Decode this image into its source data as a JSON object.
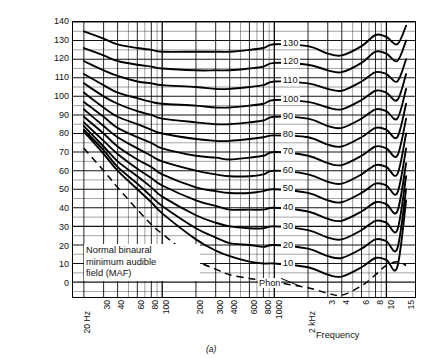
{
  "chart_data": {
    "type": "line",
    "title": "",
    "caption": "(a)",
    "xlabel": "Frequency",
    "ylabel_line1": "Sound pressure level (expressed in decibels)",
    "ylabel_line2": "above 0.0002 dyn/cm2 (2 x 10-5 N/m2)",
    "xscale": "log",
    "xlim": [
      16,
      18000
    ],
    "ylim": [
      -8,
      140
    ],
    "grid": true,
    "legend_position": "inline-labels",
    "yticks": [
      0,
      10,
      20,
      30,
      40,
      50,
      60,
      70,
      80,
      90,
      100,
      110,
      120,
      130,
      140
    ],
    "xticks": [
      {
        "value": 20,
        "label": "20 Hz"
      },
      {
        "value": 30,
        "label": "30"
      },
      {
        "value": 40,
        "label": "40"
      },
      {
        "value": 60,
        "label": "60"
      },
      {
        "value": 80,
        "label": "80"
      },
      {
        "value": 100,
        "label": "100"
      },
      {
        "value": 200,
        "label": "200"
      },
      {
        "value": 300,
        "label": "300"
      },
      {
        "value": 400,
        "label": "400"
      },
      {
        "value": 600,
        "label": "600"
      },
      {
        "value": 800,
        "label": "800"
      },
      {
        "value": 1000,
        "label": "1000"
      },
      {
        "value": 2000,
        "label": "2 kHz"
      },
      {
        "value": 3000,
        "label": "3"
      },
      {
        "value": 4000,
        "label": "4"
      },
      {
        "value": 6000,
        "label": "6"
      },
      {
        "value": 8000,
        "label": "8"
      },
      {
        "value": 10000,
        "label": "10"
      },
      {
        "value": 15000,
        "label": "15"
      }
    ],
    "series_unit": "phon",
    "series_label_text": "Phon",
    "x": [
      20,
      30,
      40,
      60,
      80,
      100,
      200,
      300,
      400,
      600,
      800,
      1000,
      2000,
      3000,
      4000,
      6000,
      8000,
      10000,
      12500,
      15000
    ],
    "series": [
      {
        "name": "130",
        "values": [
          135,
          131,
          128,
          126,
          125,
          124,
          124,
          124,
          124,
          125,
          126,
          128,
          127,
          123,
          122,
          127,
          133,
          132,
          128,
          138
        ]
      },
      {
        "name": "120",
        "values": [
          126,
          122,
          119,
          117,
          116,
          115,
          114,
          114,
          114,
          115,
          116,
          118,
          117,
          114,
          113,
          118,
          124,
          123,
          119,
          130
        ]
      },
      {
        "name": "110",
        "values": [
          119,
          114,
          111,
          108,
          107,
          106,
          105,
          104,
          104,
          105,
          106,
          108,
          107,
          104,
          103,
          108,
          113,
          112,
          108,
          120
        ]
      },
      {
        "name": "100",
        "values": [
          112,
          106,
          102,
          99,
          97,
          96,
          95,
          94,
          94,
          95,
          96,
          98,
          97,
          94,
          93,
          98,
          103,
          102,
          98,
          112
        ]
      },
      {
        "name": "90",
        "values": [
          107,
          100,
          96,
          92,
          90,
          88,
          86,
          85,
          85,
          86,
          87,
          89,
          88,
          84,
          83,
          88,
          93,
          92,
          88,
          104
        ]
      },
      {
        "name": "80",
        "values": [
          102,
          94,
          89,
          85,
          82,
          80,
          77,
          76,
          76,
          77,
          78,
          79,
          78,
          74,
          73,
          78,
          83,
          82,
          78,
          96
        ]
      },
      {
        "name": "70",
        "values": [
          97,
          89,
          83,
          78,
          75,
          72,
          68,
          67,
          66,
          67,
          68,
          70,
          68,
          64,
          63,
          68,
          73,
          72,
          68,
          88
        ]
      },
      {
        "name": "60",
        "values": [
          93,
          84,
          78,
          72,
          68,
          65,
          60,
          58,
          57,
          57,
          58,
          60,
          58,
          54,
          53,
          58,
          63,
          62,
          58,
          80
        ]
      },
      {
        "name": "50",
        "values": [
          89,
          80,
          73,
          66,
          62,
          58,
          51,
          49,
          48,
          48,
          49,
          50,
          48,
          44,
          43,
          48,
          53,
          52,
          48,
          72
        ]
      },
      {
        "name": "40",
        "values": [
          86,
          76,
          69,
          61,
          56,
          52,
          44,
          41,
          39,
          39,
          39,
          40,
          38,
          34,
          33,
          38,
          43,
          42,
          38,
          64
        ]
      },
      {
        "name": "30",
        "values": [
          84,
          73,
          65,
          57,
          51,
          46,
          36,
          32,
          30,
          29,
          29,
          30,
          28,
          24,
          23,
          28,
          33,
          32,
          28,
          57
        ]
      },
      {
        "name": "20",
        "values": [
          82,
          71,
          62,
          53,
          46,
          41,
          29,
          24,
          21,
          20,
          19,
          20,
          18,
          14,
          13,
          18,
          23,
          22,
          18,
          50
        ]
      },
      {
        "name": "10",
        "values": [
          81,
          69,
          60,
          50,
          43,
          37,
          23,
          17,
          14,
          11,
          10,
          10,
          8,
          4,
          3,
          8,
          13,
          12,
          8,
          44
        ]
      }
    ],
    "maf_curve": {
      "label_line1": "Normal binaural",
      "label_line2": "minimum audible",
      "label_line3": "field (MAF)",
      "style": "dashed",
      "x": [
        20,
        30,
        40,
        60,
        80,
        100,
        200,
        300,
        400,
        600,
        800,
        1000,
        2000,
        3000,
        4000,
        6000,
        8000,
        10000,
        12500,
        15000
      ],
      "values": [
        72,
        60,
        51,
        39,
        31,
        26,
        12,
        7,
        4,
        2,
        1,
        0,
        -3,
        -6,
        -7,
        -2,
        4,
        9,
        11,
        9
      ]
    }
  }
}
